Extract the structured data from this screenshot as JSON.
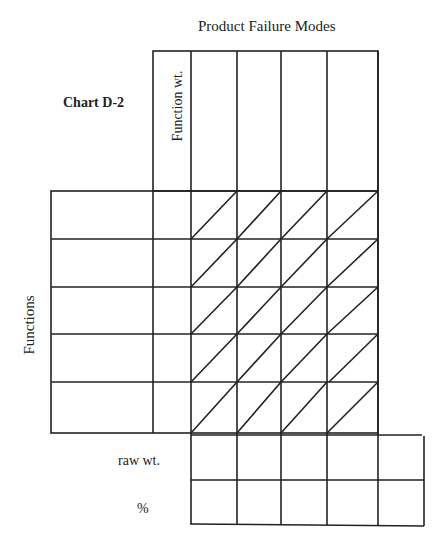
{
  "title": "Product Failure Modes",
  "chart_label": "Chart D-2",
  "column_header": "Function wt.",
  "row_axis_label": "Functions",
  "bottom_rows": [
    "raw wt.",
    "%"
  ],
  "grid": {
    "function_rows": 5,
    "failure_mode_columns": 4,
    "diagonal_split_cells": true,
    "line_color": "#222222"
  }
}
